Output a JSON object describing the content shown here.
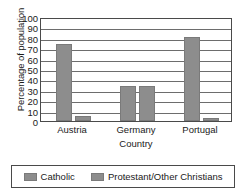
{
  "chart_data": {
    "type": "bar",
    "title": "",
    "categories": [
      "Austria",
      "Germany",
      "Portugal"
    ],
    "series": [
      {
        "name": "Catholic",
        "values": [
          74,
          34,
          81
        ],
        "color": "#8d8d8d"
      },
      {
        "name": "Protestant/Other Christians",
        "values": [
          5,
          34,
          3
        ],
        "color": "#8d8d8d"
      }
    ],
    "xlabel": "Country",
    "ylabel": "Percentage of population",
    "ylim": [
      0,
      100
    ],
    "ytick_labels": [
      "100",
      "90",
      "80",
      "70",
      "60",
      "50",
      "40",
      "30",
      "20",
      "10",
      "0"
    ],
    "ytick_values": [
      100,
      90,
      80,
      70,
      60,
      50,
      40,
      30,
      20,
      10,
      0
    ],
    "grid": true,
    "legend_position": "bottom"
  },
  "legend": {
    "entries": [
      {
        "label": "Catholic"
      },
      {
        "label": "Protestant/Other Christians"
      }
    ]
  },
  "colors": {
    "bar": "#8d8d8d",
    "grid": "#6d6d6d",
    "frame": "#4a4a4a",
    "text": "#1a1a1a",
    "background": "#ffffff"
  }
}
